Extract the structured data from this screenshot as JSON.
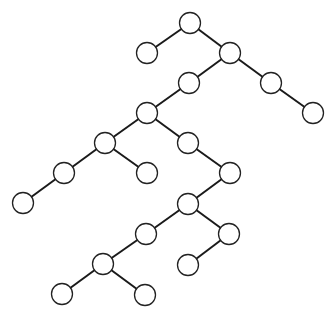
{
  "diagram": {
    "type": "binary-tree",
    "nodes": [
      {
        "id": "A",
        "label": ""
      },
      {
        "id": "B",
        "label": ""
      },
      {
        "id": "C",
        "label": ""
      },
      {
        "id": "D",
        "label": ""
      },
      {
        "id": "E",
        "label": ""
      },
      {
        "id": "F",
        "label": ""
      },
      {
        "id": "G",
        "label": ""
      },
      {
        "id": "H",
        "label": ""
      },
      {
        "id": "I",
        "label": ""
      },
      {
        "id": "J",
        "label": ""
      },
      {
        "id": "K",
        "label": ""
      },
      {
        "id": "L",
        "label": ""
      },
      {
        "id": "M",
        "label": ""
      },
      {
        "id": "N",
        "label": ""
      },
      {
        "id": "O",
        "label": ""
      },
      {
        "id": "P",
        "label": ""
      },
      {
        "id": "Q",
        "label": ""
      },
      {
        "id": "R",
        "label": ""
      },
      {
        "id": "S",
        "label": ""
      },
      {
        "id": "T",
        "label": ""
      }
    ],
    "edges": [
      {
        "parent": "A",
        "child": "B",
        "side": "left"
      },
      {
        "parent": "A",
        "child": "C",
        "side": "right"
      },
      {
        "parent": "C",
        "child": "D",
        "side": "left"
      },
      {
        "parent": "C",
        "child": "E",
        "side": "right"
      },
      {
        "parent": "E",
        "child": "F",
        "side": "right"
      },
      {
        "parent": "D",
        "child": "G",
        "side": "left"
      },
      {
        "parent": "G",
        "child": "H",
        "side": "left"
      },
      {
        "parent": "G",
        "child": "I",
        "side": "right"
      },
      {
        "parent": "H",
        "child": "J",
        "side": "left"
      },
      {
        "parent": "H",
        "child": "K",
        "side": "right"
      },
      {
        "parent": "J",
        "child": "M",
        "side": "left"
      },
      {
        "parent": "I",
        "child": "L",
        "side": "right"
      },
      {
        "parent": "L",
        "child": "N",
        "side": "left"
      },
      {
        "parent": "N",
        "child": "O",
        "side": "left"
      },
      {
        "parent": "N",
        "child": "P",
        "side": "right"
      },
      {
        "parent": "P",
        "child": "R",
        "side": "left"
      },
      {
        "parent": "O",
        "child": "Q",
        "side": "left"
      },
      {
        "parent": "Q",
        "child": "S",
        "side": "left"
      },
      {
        "parent": "Q",
        "child": "T",
        "side": "right"
      }
    ],
    "colors": {
      "edge": "#1a1a1a",
      "node_fill": "#ffffff",
      "node_stroke": "#222222",
      "background": "#ffffff"
    }
  }
}
